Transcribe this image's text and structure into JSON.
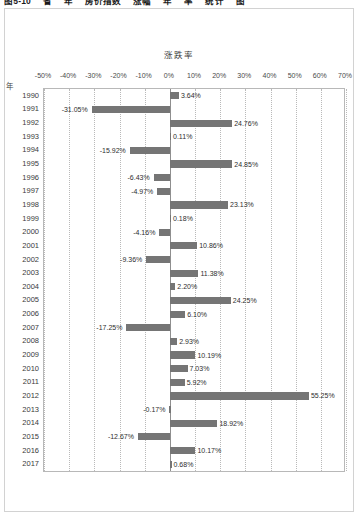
{
  "figure": {
    "caption": "图5-10 　省 　年 　房价指数 　涨幅 　年 　率 　统计 　图"
  },
  "chart_data": {
    "type": "bar",
    "orientation": "horizontal",
    "title": "涨跌率",
    "xlabel": "",
    "ylabel": "年",
    "xlim": [
      -50,
      70
    ],
    "xticks": [
      "-50%",
      "-40%",
      "-30%",
      "-20%",
      "-10%",
      "0%",
      "10%",
      "20%",
      "30%",
      "40%",
      "50%",
      "60%",
      "70%"
    ],
    "xtick_values": [
      -50,
      -40,
      -30,
      -20,
      -10,
      0,
      10,
      20,
      30,
      40,
      50,
      60,
      70
    ],
    "grid": true,
    "legend": "none",
    "bar_color": "#757575",
    "categories": [
      "1990",
      "1991",
      "1992",
      "1993",
      "1994",
      "1995",
      "1996",
      "1997",
      "1998",
      "1999",
      "2000",
      "2001",
      "2002",
      "2003",
      "2004",
      "2005",
      "2006",
      "2007",
      "2008",
      "2009",
      "2010",
      "2011",
      "2012",
      "2013",
      "2014",
      "2015",
      "2016",
      "2017"
    ],
    "values": [
      3.64,
      -31.05,
      24.76,
      0.11,
      -15.92,
      24.85,
      -6.43,
      -4.97,
      23.13,
      0.18,
      -4.16,
      10.86,
      -9.36,
      11.38,
      2.2,
      24.25,
      6.1,
      -17.25,
      2.93,
      10.19,
      7.03,
      5.92,
      55.25,
      -0.17,
      18.92,
      -12.67,
      10.17,
      0.68
    ],
    "data_labels": [
      "3.64%",
      "-31.05%",
      "24.76%",
      "0.11%",
      "-15.92%",
      "24.85%",
      "-6.43%",
      "-4.97%",
      "23.13%",
      "0.18%",
      "-4.16%",
      "10.86%",
      "-9.36%",
      "11.38%",
      "2.20%",
      "24.25%",
      "6.10%",
      "-17.25%",
      "2.93%",
      "10.19%",
      "7.03%",
      "5.92%",
      "55.25%",
      "-0.17%",
      "18.92%",
      "-12.67%",
      "10.17%",
      "0.68%"
    ]
  }
}
